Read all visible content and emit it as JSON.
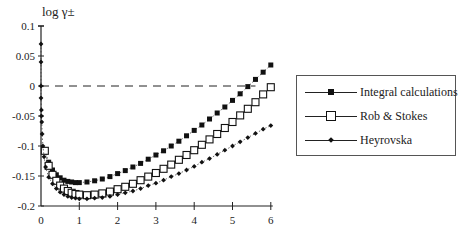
{
  "chart_data": {
    "type": "scatter",
    "title": "",
    "ylabel": "log γ±",
    "xlabel": "",
    "xlim": [
      0,
      6
    ],
    "ylim": [
      -0.2,
      0.1
    ],
    "xticks": [
      "0",
      "1",
      "2",
      "3",
      "4",
      "5",
      "6"
    ],
    "yticks": [
      "0.1",
      "0.05",
      "0",
      "-0.05",
      "-0.1",
      "-0.15",
      "-0.2"
    ],
    "grid": false,
    "reference_line": {
      "y": 0,
      "style": "dashed",
      "x_range": [
        0,
        5.6
      ]
    },
    "legend_position": "right",
    "series": [
      {
        "name": "Integral calculations",
        "marker": "filled-square",
        "x": [
          0.1,
          0.2,
          0.3,
          0.4,
          0.5,
          0.6,
          0.7,
          0.8,
          0.9,
          1.0,
          1.2,
          1.4,
          1.6,
          1.8,
          2.0,
          2.2,
          2.4,
          2.6,
          2.8,
          3.0,
          3.2,
          3.4,
          3.6,
          3.8,
          4.0,
          4.2,
          4.4,
          4.6,
          4.8,
          5.0,
          5.2,
          5.4,
          5.6,
          5.8,
          6.0
        ],
        "y": [
          -0.107,
          -0.127,
          -0.14,
          -0.148,
          -0.153,
          -0.157,
          -0.159,
          -0.16,
          -0.161,
          -0.161,
          -0.16,
          -0.158,
          -0.155,
          -0.151,
          -0.146,
          -0.141,
          -0.135,
          -0.129,
          -0.122,
          -0.115,
          -0.108,
          -0.1,
          -0.092,
          -0.083,
          -0.074,
          -0.065,
          -0.055,
          -0.045,
          -0.035,
          -0.024,
          -0.013,
          -0.001,
          0.011,
          0.023,
          0.035
        ]
      },
      {
        "name": "Rob & Stokes",
        "marker": "open-square",
        "x": [
          0.1,
          0.2,
          0.3,
          0.4,
          0.5,
          0.6,
          0.7,
          0.8,
          0.9,
          1.0,
          1.2,
          1.4,
          1.6,
          1.8,
          2.0,
          2.2,
          2.4,
          2.6,
          2.8,
          3.0,
          3.2,
          3.4,
          3.6,
          3.8,
          4.0,
          4.2,
          4.4,
          4.6,
          4.8,
          5.0,
          5.2,
          5.4,
          5.6,
          5.8,
          6.0
        ],
        "y": [
          -0.108,
          -0.133,
          -0.148,
          -0.158,
          -0.166,
          -0.171,
          -0.175,
          -0.178,
          -0.18,
          -0.181,
          -0.182,
          -0.181,
          -0.179,
          -0.176,
          -0.172,
          -0.168,
          -0.163,
          -0.157,
          -0.151,
          -0.145,
          -0.138,
          -0.131,
          -0.123,
          -0.115,
          -0.107,
          -0.098,
          -0.089,
          -0.08,
          -0.07,
          -0.06,
          -0.049,
          -0.038,
          -0.027,
          -0.014,
          -0.002
        ]
      },
      {
        "name": "Heyrovska",
        "marker": "filled-diamond",
        "x": [
          0.0,
          0.0,
          0.0,
          0.0,
          0.01,
          0.01,
          0.02,
          0.03,
          0.05,
          0.08,
          0.12,
          0.2,
          0.3,
          0.4,
          0.5,
          0.6,
          0.7,
          0.8,
          0.9,
          1.0,
          1.2,
          1.4,
          1.6,
          1.8,
          2.0,
          2.2,
          2.4,
          2.6,
          2.8,
          3.0,
          3.2,
          3.4,
          3.6,
          3.8,
          4.0,
          4.2,
          4.4,
          4.6,
          4.8,
          5.0,
          5.2,
          5.4,
          5.6,
          5.8,
          6.0
        ],
        "y": [
          0.07,
          0.04,
          0.0,
          -0.02,
          -0.04,
          -0.05,
          -0.06,
          -0.08,
          -0.1,
          -0.118,
          -0.135,
          -0.152,
          -0.163,
          -0.171,
          -0.177,
          -0.181,
          -0.184,
          -0.186,
          -0.187,
          -0.188,
          -0.188,
          -0.187,
          -0.186,
          -0.184,
          -0.181,
          -0.178,
          -0.175,
          -0.171,
          -0.166,
          -0.162,
          -0.157,
          -0.151,
          -0.146,
          -0.14,
          -0.134,
          -0.127,
          -0.121,
          -0.114,
          -0.107,
          -0.1,
          -0.093,
          -0.086,
          -0.079,
          -0.072,
          -0.066
        ]
      }
    ]
  },
  "legend": {
    "items": [
      {
        "label": "Integral calculations"
      },
      {
        "label": "Rob & Stokes"
      },
      {
        "label": "Heyrovska"
      }
    ]
  },
  "axes": {
    "ylabel": "log γ±"
  }
}
